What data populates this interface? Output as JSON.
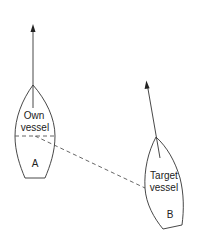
{
  "diagram": {
    "type": "vessel-encounter",
    "colors": {
      "line": "#333333",
      "dash": "#555555",
      "background": "#ffffff"
    },
    "own_vessel": {
      "label_line1": "Own",
      "label_line2": "vessel",
      "letter": "A",
      "heading_arrow": "up"
    },
    "target_vessel": {
      "label_line1": "Target",
      "label_line2": "vessel",
      "letter": "B",
      "heading_arrow": "up-left"
    },
    "bearing_line": {
      "style": "dashed",
      "from": "A",
      "to": "B"
    }
  }
}
